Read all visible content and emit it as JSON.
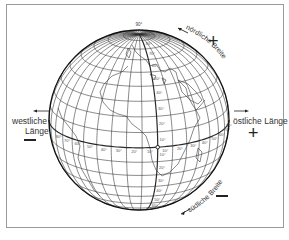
{
  "diagram": {
    "type": "globe-coordinate-system",
    "labels": {
      "north_latitude": "nördliche Breite",
      "south_latitude": "südliche Breite",
      "west_longitude_line1": "westliche",
      "west_longitude_line2": "Länge",
      "east_longitude": "östliche Länge",
      "north_sign": "+",
      "south_sign": "−",
      "west_sign": "−",
      "east_sign": "+",
      "pole_label": "90°"
    },
    "equator_tick_labels_west": [
      "10°",
      "20°",
      "30°",
      "40°",
      "50°",
      "60°",
      "70°",
      "80°"
    ],
    "equator_tick_labels_east": [
      "10°",
      "20°",
      "30°",
      "40°",
      "50°",
      "60°",
      "70°",
      "80°"
    ],
    "meridian_tick_labels_north": [
      "10°",
      "20°",
      "30°",
      "40°",
      "50°",
      "60°",
      "70°",
      "80°"
    ],
    "meridian_tick_labels_south": [
      "10°",
      "20°",
      "30°",
      "40°",
      "50°",
      "60°",
      "70°",
      "80°"
    ],
    "globe": {
      "center_x": 139,
      "center_y": 120,
      "radius": 90,
      "tilt_deg": 18,
      "central_lon_deg": -12,
      "graticule_step_deg": 10,
      "line_color": "#2a2a2a",
      "outline_color": "#111111"
    }
  }
}
